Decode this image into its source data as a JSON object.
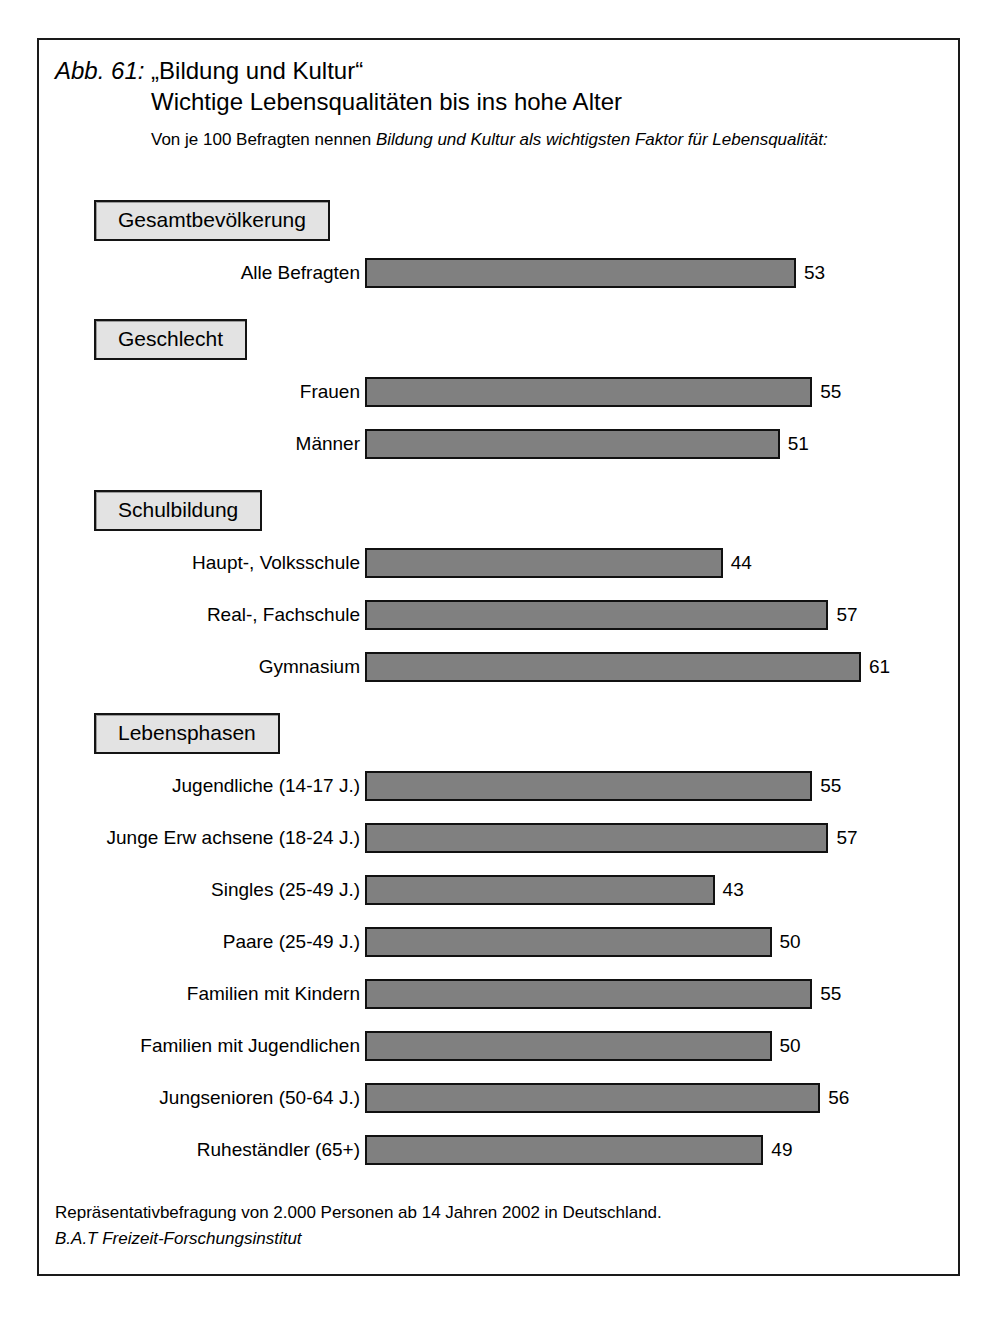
{
  "figure": {
    "number_label": "Abb. 61:",
    "title_quoted": "„Bildung und Kultur“",
    "title_line2": "Wichtige Lebensqualitäten bis ins hohe Alter",
    "subtitle_part1": "Von je 100 Befragten nennen ",
    "subtitle_emphasis": "Bildung und Kultur als wichtigsten Faktor für Lebensqualität:",
    "footer_line1": "Repräsentativbefragung von 2.000 Personen ab 14 Jahren 2002 in Deutschland.",
    "footer_line2": "B.A.T Freizeit-Forschungsinstitut"
  },
  "colors": {
    "bar_fill": "#808080",
    "bar_border": "#111111",
    "header_fill": "#e3e3e3",
    "header_border": "#141414",
    "frame": "#1a1a1a"
  },
  "groups": [
    {
      "header": "Gesamtbevölkerung",
      "rows": [
        {
          "label": "Alle Befragten",
          "value": 53
        }
      ]
    },
    {
      "header": "Geschlecht",
      "rows": [
        {
          "label": "Frauen",
          "value": 55
        },
        {
          "label": "Männer",
          "value": 51
        }
      ]
    },
    {
      "header": "Schulbildung",
      "rows": [
        {
          "label": "Haupt-, Volksschule",
          "value": 44
        },
        {
          "label": "Real-, Fachschule",
          "value": 57
        },
        {
          "label": "Gymnasium",
          "value": 61
        }
      ]
    },
    {
      "header": "Lebensphasen",
      "rows": [
        {
          "label": "Jugendliche (14-17 J.)",
          "value": 55
        },
        {
          "label": "Junge Erw achsene (18-24 J.)",
          "value": 57
        },
        {
          "label": "Singles (25-49 J.)",
          "value": 43
        },
        {
          "label": "Paare (25-49 J.)",
          "value": 50
        },
        {
          "label": "Familien mit Kindern",
          "value": 55
        },
        {
          "label": "Familien mit Jugendlichen",
          "value": 50
        },
        {
          "label": "Jungsenioren (50-64 J.)",
          "value": 56
        },
        {
          "label": "Ruheständler (65+)",
          "value": 49
        }
      ]
    }
  ],
  "chart_data": {
    "type": "bar",
    "orientation": "horizontal",
    "subtitle": "Von je 100 Befragten nennen Bildung und Kultur als wichtigsten Faktor für Lebensqualität:",
    "xlabel": "",
    "ylabel": "",
    "xlim": [
      0,
      61
    ],
    "grid": false,
    "legend": "none",
    "value_labels": true,
    "unit": "von je 100 Befragten",
    "categories": [
      "Alle Befragten",
      "Frauen",
      "Männer",
      "Haupt-, Volksschule",
      "Real-, Fachschule",
      "Gymnasium",
      "Jugendliche (14-17 J.)",
      "Junge Erw achsene (18-24 J.)",
      "Singles (25-49 J.)",
      "Paare (25-49 J.)",
      "Familien mit Kindern",
      "Familien mit Jugendlichen",
      "Jungsenioren (50-64 J.)",
      "Ruheständler (65+)"
    ],
    "values": [
      53,
      55,
      51,
      44,
      57,
      61,
      55,
      57,
      43,
      50,
      55,
      50,
      56,
      49
    ],
    "group_headers": [
      "Gesamtbevölkerung",
      "Geschlecht",
      "Schulbildung",
      "Lebensphasen"
    ],
    "group_membership": [
      "Gesamtbevölkerung",
      "Geschlecht",
      "Geschlecht",
      "Schulbildung",
      "Schulbildung",
      "Schulbildung",
      "Lebensphasen",
      "Lebensphasen",
      "Lebensphasen",
      "Lebensphasen",
      "Lebensphasen",
      "Lebensphasen",
      "Lebensphasen",
      "Lebensphasen"
    ],
    "annotations": [
      "Repräsentativbefragung von 2.000 Personen ab 14 Jahren 2002 in Deutschland.",
      "B.A.T Freizeit-Forschungsinstitut"
    ]
  }
}
